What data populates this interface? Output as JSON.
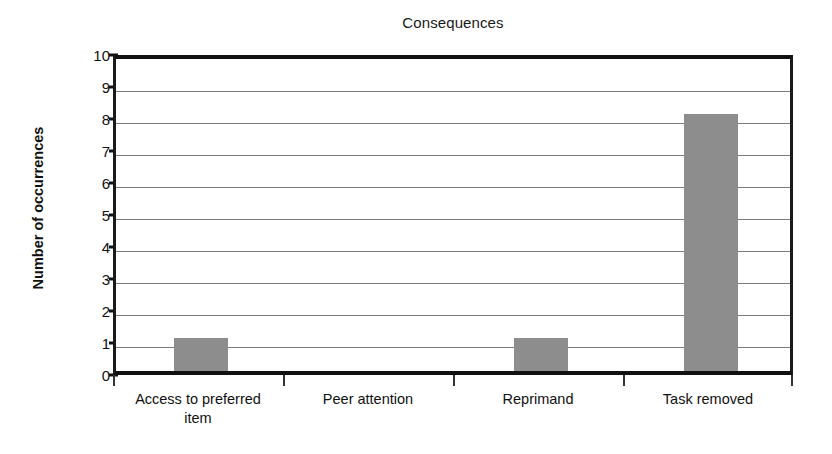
{
  "chart_data": {
    "type": "bar",
    "title": "Consequences",
    "xlabel": "",
    "ylabel": "Number of occurrences",
    "categories": [
      "Access to preferred item",
      "Peer attention",
      "Reprimand",
      "Task removed"
    ],
    "values": [
      1,
      0,
      1,
      8
    ],
    "ylim": [
      0,
      10
    ],
    "ytick_labels": [
      "10",
      "9",
      "8",
      "7",
      "6",
      "5",
      "4",
      "3",
      "2",
      "1",
      "0"
    ],
    "ytick_values": [
      10,
      9,
      8,
      7,
      6,
      5,
      4,
      3,
      2,
      1,
      0
    ],
    "grid": "horizontal",
    "legend": "none",
    "bar_color": "#8d8d8d",
    "axis_color": "#111111",
    "gridline_color": "#7b7b7b",
    "background": "#ffffff"
  },
  "category_label_lines": [
    [
      "Access to preferred",
      "item"
    ],
    [
      "Peer attention",
      ""
    ],
    [
      "Reprimand",
      ""
    ],
    [
      "Task removed",
      ""
    ]
  ]
}
